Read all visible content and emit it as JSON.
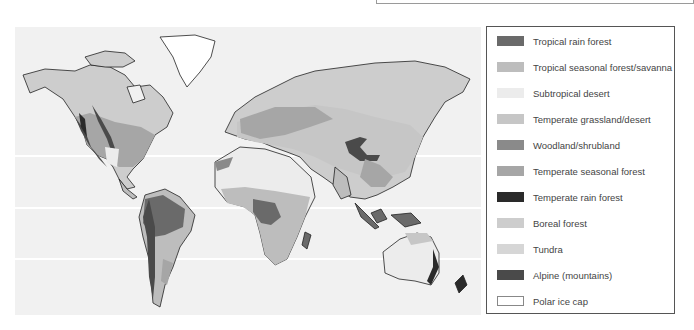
{
  "figure": {
    "type": "world-biome-map",
    "gridlines": "latitude lines shown as faint white horizontal bands"
  },
  "legend": {
    "items": [
      {
        "label": "Tropical rain forest",
        "color": "#6a6a6a"
      },
      {
        "label": "Tropical seasonal forest/savanna",
        "color": "#bdbdbd"
      },
      {
        "label": "Subtropical desert",
        "color": "#ececec"
      },
      {
        "label": "Temperate grassland/desert",
        "color": "#c6c6c6"
      },
      {
        "label": "Woodland/shrubland",
        "color": "#8a8a8a"
      },
      {
        "label": "Temperate seasonal forest",
        "color": "#a6a6a6"
      },
      {
        "label": "Temperate rain forest",
        "color": "#2a2a2a"
      },
      {
        "label": "Boreal forest",
        "color": "#cdcdcd"
      },
      {
        "label": "Tundra",
        "color": "#d6d6d6"
      },
      {
        "label": "Alpine (mountains)",
        "color": "#4a4a4a"
      },
      {
        "label": "Polar ice cap",
        "color": "#ffffff"
      }
    ]
  }
}
